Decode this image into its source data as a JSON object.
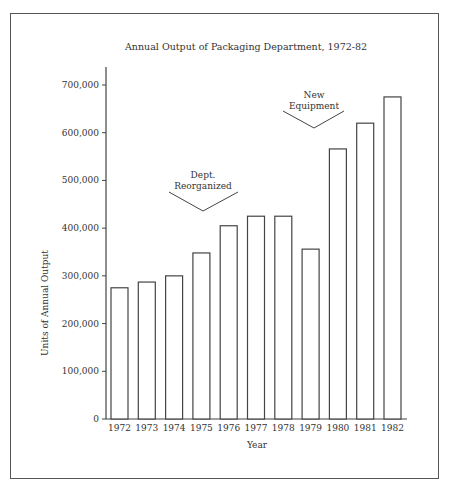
{
  "chart_data": {
    "type": "bar",
    "title": "Annual Output of Packaging Department, 1972-82",
    "xlabel": "Year",
    "ylabel": "Units of Annual Output",
    "categories": [
      "1972",
      "1973",
      "1974",
      "1975",
      "1976",
      "1977",
      "1978",
      "1979",
      "1980",
      "1981",
      "1982"
    ],
    "values": [
      275000,
      287000,
      300000,
      348000,
      405000,
      425000,
      425000,
      356000,
      566000,
      620000,
      675000
    ],
    "ylim": [
      0,
      700000
    ],
    "yticks": [
      "0",
      "100,000",
      "200,000",
      "300,000",
      "400,000",
      "500,000",
      "600,000",
      "700,000"
    ],
    "grid": false,
    "legend": null,
    "annotations": [
      {
        "lines": [
          "Dept.",
          "Reorganized"
        ],
        "points_to": "1975"
      },
      {
        "lines": [
          "New",
          "Equipment"
        ],
        "points_to": "1979"
      }
    ]
  }
}
